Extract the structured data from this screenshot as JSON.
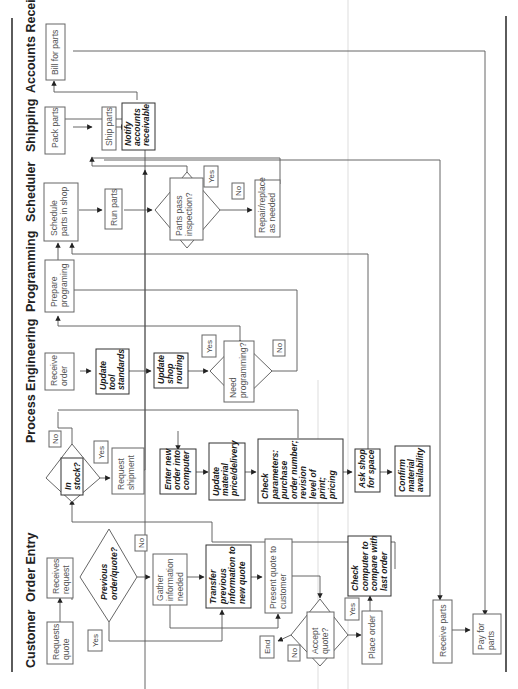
{
  "orientation": "rotated 90 degrees counter-clockwise (text reads bottom-to-top)",
  "lanes": [
    {
      "id": "customer",
      "label": "Customer"
    },
    {
      "id": "order_entry",
      "label": "Order Entry"
    },
    {
      "id": "process_engineering",
      "label": "Process Engineering"
    },
    {
      "id": "programming",
      "label": "Programming"
    },
    {
      "id": "scheduler",
      "label": "Scheduler"
    },
    {
      "id": "shipping",
      "label": "Shipping"
    },
    {
      "id": "accounts_receivable",
      "label": "Accounts Receivable"
    }
  ],
  "nodes": [
    {
      "id": "requests_quote",
      "lane": "customer",
      "type": "box",
      "style": "normal",
      "lines": [
        "Requests",
        "quote"
      ]
    },
    {
      "id": "receives_request",
      "lane": "order_entry",
      "type": "box",
      "style": "normal",
      "lines": [
        "Receives",
        "request"
      ]
    },
    {
      "id": "previous_order",
      "lane": "order_entry",
      "type": "decision",
      "style": "bold",
      "lines": [
        "Previous",
        "order/quote?"
      ]
    },
    {
      "id": "gather_info",
      "lane": "order_entry",
      "type": "box",
      "style": "normal",
      "lines": [
        "Gather",
        "information",
        "needed"
      ]
    },
    {
      "id": "transfer_info",
      "lane": "order_entry",
      "type": "box",
      "style": "bold",
      "lines": [
        "Transfer",
        "previous",
        "information to",
        "new quote"
      ]
    },
    {
      "id": "present_quote",
      "lane": "order_entry",
      "type": "box",
      "style": "normal",
      "lines": [
        "Present quote to",
        "customer"
      ]
    },
    {
      "id": "accept_quote",
      "lane": "customer",
      "type": "decision",
      "style": "normal",
      "lines": [
        "Accept",
        "quote?"
      ]
    },
    {
      "id": "end",
      "lane": "customer",
      "type": "label",
      "style": "normal",
      "lines": [
        "End"
      ]
    },
    {
      "id": "place_order",
      "lane": "customer",
      "type": "box",
      "style": "normal",
      "lines": [
        "Place order"
      ]
    },
    {
      "id": "check_computer",
      "lane": "order_entry",
      "type": "box",
      "style": "bold",
      "lines": [
        "Check",
        "computer to",
        "compare with",
        "last order"
      ]
    },
    {
      "id": "in_stock",
      "lane": "order_entry",
      "type": "decision",
      "style": "bold",
      "lines": [
        "In",
        "stock?"
      ]
    },
    {
      "id": "request_shipment",
      "lane": "order_entry",
      "type": "box",
      "style": "normal",
      "lines": [
        "Request",
        "shipment"
      ]
    },
    {
      "id": "enter_new_order",
      "lane": "order_entry",
      "type": "box",
      "style": "bold",
      "lines": [
        "Enter new",
        "order into",
        "computer"
      ]
    },
    {
      "id": "update_material",
      "lane": "order_entry",
      "type": "box",
      "style": "bold",
      "lines": [
        "Update",
        "material",
        "price/delivery"
      ]
    },
    {
      "id": "check_parameters",
      "lane": "order_entry",
      "type": "box",
      "style": "bold",
      "lines": [
        "Check",
        "parameters:",
        "purchase",
        "order number;",
        "revision",
        "level of",
        "print;",
        "pricing"
      ]
    },
    {
      "id": "ask_shop",
      "lane": "order_entry",
      "type": "box",
      "style": "bold",
      "lines": [
        "Ask shop",
        "for space"
      ]
    },
    {
      "id": "confirm_material",
      "lane": "order_entry",
      "type": "box",
      "style": "bold",
      "lines": [
        "Confirm",
        "material",
        "availability"
      ]
    },
    {
      "id": "receive_order",
      "lane": "process_engineering",
      "type": "box",
      "style": "normal",
      "lines": [
        "Receive",
        "order"
      ]
    },
    {
      "id": "update_tool",
      "lane": "process_engineering",
      "type": "box",
      "style": "bold",
      "lines": [
        "Update",
        "tool",
        "standards"
      ]
    },
    {
      "id": "update_routing",
      "lane": "process_engineering",
      "type": "box",
      "style": "bold",
      "lines": [
        "Update",
        "shop",
        "routing"
      ]
    },
    {
      "id": "need_programming",
      "lane": "process_engineering",
      "type": "decision",
      "style": "normal",
      "lines": [
        "Need",
        "programming?"
      ]
    },
    {
      "id": "prepare_programming",
      "lane": "programming",
      "type": "box",
      "style": "normal",
      "lines": [
        "Prepare",
        "programing"
      ]
    },
    {
      "id": "schedule_parts",
      "lane": "scheduler",
      "type": "box",
      "style": "normal",
      "lines": [
        "Schedule",
        "parts in shop"
      ]
    },
    {
      "id": "run_parts",
      "lane": "scheduler",
      "type": "box",
      "style": "normal",
      "lines": [
        "Run parts"
      ]
    },
    {
      "id": "parts_pass",
      "lane": "scheduler",
      "type": "decision",
      "style": "normal",
      "lines": [
        "Parts pass",
        "inspection?"
      ]
    },
    {
      "id": "repair_replace",
      "lane": "scheduler",
      "type": "box",
      "style": "normal",
      "lines": [
        "Repair/replace",
        "as needed"
      ]
    },
    {
      "id": "pack_parts",
      "lane": "shipping",
      "type": "box",
      "style": "normal",
      "lines": [
        "Pack parts"
      ]
    },
    {
      "id": "ship_parts",
      "lane": "shipping",
      "type": "box",
      "style": "normal",
      "lines": [
        "Ship parts"
      ]
    },
    {
      "id": "notify_ar",
      "lane": "shipping",
      "type": "box",
      "style": "bold",
      "lines": [
        "Notify",
        "accounts",
        "receivable"
      ]
    },
    {
      "id": "bill_for_parts",
      "lane": "accounts_receivable",
      "type": "box",
      "style": "normal",
      "lines": [
        "Bill for parts"
      ]
    },
    {
      "id": "receive_parts",
      "lane": "customer",
      "type": "box",
      "style": "normal",
      "lines": [
        "Receive parts"
      ]
    },
    {
      "id": "pay_for_parts",
      "lane": "customer",
      "type": "box",
      "style": "normal",
      "lines": [
        "Pay for",
        "parts"
      ]
    }
  ],
  "branch_labels": {
    "previous_yes": "Yes",
    "previous_no": "No",
    "accept_yes": "Yes",
    "accept_no": "No",
    "in_stock_yes": "Yes",
    "in_stock_no": "No",
    "need_prog_yes": "Yes",
    "need_prog_no": "No",
    "pass_yes": "Yes",
    "pass_no": "No"
  },
  "edges": [
    [
      "requests_quote",
      "receives_request"
    ],
    [
      "receives_request",
      "previous_order"
    ],
    [
      "previous_order",
      "gather_info",
      "No"
    ],
    [
      "previous_order",
      "transfer_info",
      "Yes"
    ],
    [
      "gather_info",
      "transfer_info"
    ],
    [
      "transfer_info",
      "present_quote"
    ],
    [
      "gather_info",
      "present_quote"
    ],
    [
      "present_quote",
      "accept_quote"
    ],
    [
      "accept_quote",
      "end",
      "No"
    ],
    [
      "accept_quote",
      "place_order",
      "Yes"
    ],
    [
      "place_order",
      "check_computer"
    ],
    [
      "check_computer",
      "in_stock"
    ],
    [
      "in_stock",
      "request_shipment",
      "Yes"
    ],
    [
      "in_stock",
      "receive_order",
      "No"
    ],
    [
      "request_shipment",
      "pack_parts"
    ],
    [
      "enter_new_order",
      "update_material"
    ],
    [
      "update_material",
      "check_parameters"
    ],
    [
      "check_parameters",
      "ask_shop"
    ],
    [
      "ask_shop",
      "confirm_material"
    ],
    [
      "receive_order",
      "update_tool"
    ],
    [
      "update_tool",
      "update_routing"
    ],
    [
      "update_routing",
      "need_programming"
    ],
    [
      "need_programming",
      "prepare_programming",
      "Yes"
    ],
    [
      "need_programming",
      "schedule_parts",
      "No"
    ],
    [
      "prepare_programming",
      "schedule_parts"
    ],
    [
      "schedule_parts",
      "run_parts"
    ],
    [
      "run_parts",
      "parts_pass"
    ],
    [
      "parts_pass",
      "ship_parts",
      "Yes"
    ],
    [
      "parts_pass",
      "repair_replace",
      "No"
    ],
    [
      "pack_parts",
      "ship_parts"
    ],
    [
      "ship_parts",
      "notify_ar"
    ],
    [
      "notify_ar",
      "bill_for_parts"
    ],
    [
      "ship_parts",
      "receive_parts"
    ],
    [
      "bill_for_parts",
      "pay_for_parts"
    ],
    [
      "receive_parts",
      "pay_for_parts"
    ]
  ],
  "colors": {
    "background": "#ffffff",
    "line": "#555555",
    "box_border": "#666666",
    "text": "#555555",
    "bold_text": "#1a1a1a",
    "rule": "#333333"
  }
}
